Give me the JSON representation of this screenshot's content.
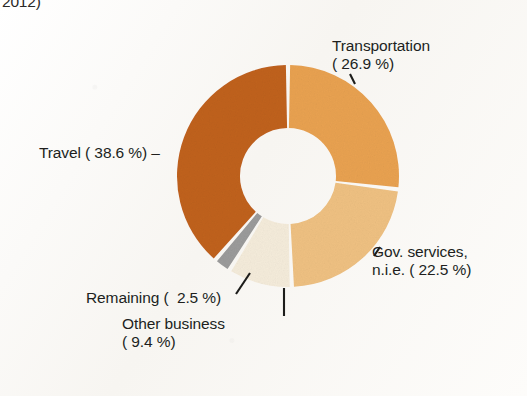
{
  "caption": {
    "fragment_text": "2012)"
  },
  "chart_data": {
    "type": "pie",
    "variant": "donut",
    "title": "",
    "subtitle": "",
    "xlabel": "",
    "ylabel": "",
    "legend_position": "none",
    "grid": false,
    "units": "percent",
    "start_angle_deg": 0,
    "direction": "clockwise",
    "total": 99.9,
    "categories": [
      "Transportation",
      "Gov. services, n.i.e.",
      "Other business",
      "Remaining",
      "Travel"
    ],
    "values": [
      26.9,
      22.5,
      9.4,
      2.5,
      38.6
    ],
    "colors": [
      "#E9A251",
      "#EFC182",
      "#F5ECDB",
      "#9B9B9B",
      "#C0621F"
    ],
    "slices": [
      {
        "name": "Transportation",
        "value": 26.9,
        "value_text": "26.9 %",
        "label": "Transportation",
        "label_line1": "Transportation",
        "label_line2": "( 26.9 %)",
        "color": "#E9A251"
      },
      {
        "name": "Gov. services, n.i.e.",
        "value": 22.5,
        "value_text": "22.5 %",
        "label": "Gov. services, n.i.e.",
        "label_line1": "Gov. services,",
        "label_line2": "n.i.e. ( 22.5 %)",
        "color": "#EFC182"
      },
      {
        "name": "Other business",
        "value": 9.4,
        "value_text": "9.4 %",
        "label": "Other business",
        "label_line1": "Other business",
        "label_line2": "( 9.4 %)",
        "color": "#F5ECDB"
      },
      {
        "name": "Remaining",
        "value": 2.5,
        "value_text": "2.5 %",
        "label": "Remaining",
        "label_line1": "Remaining (  2.5 %)",
        "label_line2": "",
        "color": "#9B9B9B"
      },
      {
        "name": "Travel",
        "value": 38.6,
        "value_text": "38.6 %",
        "label": "Travel",
        "label_line1": "Travel ( 38.6 %)",
        "label_line2": "",
        "color": "#C0621F"
      }
    ]
  },
  "labels": {
    "transportation": "Transportation\n( 26.9 %)",
    "travel": "Travel ( 38.6 %) –",
    "gov_services": "Gov. services,\nn.i.e. ( 22.5 %)",
    "remaining": "Remaining (  2.5 %)",
    "other_business": "Other business\n( 9.4 %)"
  },
  "geometry": {
    "center_x": 288,
    "center_y": 176,
    "outer_radius": 111,
    "inner_radius": 48,
    "gap_degrees": 2.2
  }
}
